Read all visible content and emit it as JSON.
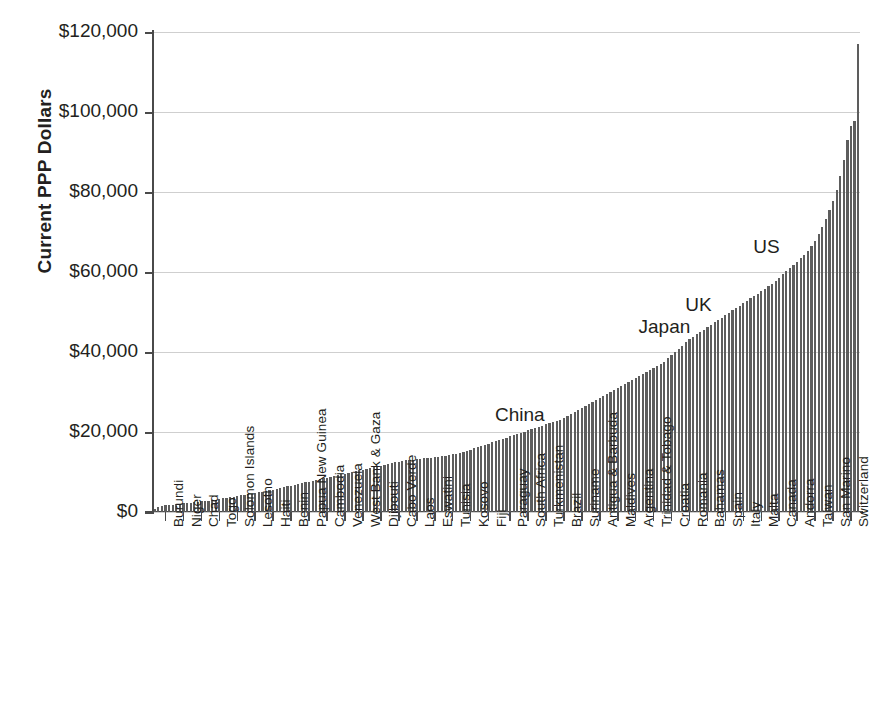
{
  "chart_data": {
    "type": "bar",
    "title": "",
    "subtitle": "",
    "xlabel": "",
    "ylabel": "Current PPP Dollars",
    "ylim": [
      0,
      120000
    ],
    "y_ticks": [
      0,
      20000,
      40000,
      60000,
      80000,
      100000,
      120000
    ],
    "y_tick_labels": [
      "$0",
      "$20,000",
      "$40,000",
      "$60,000",
      "$80,000",
      "$100,000",
      "$120,000"
    ],
    "grid": true,
    "legend": "none",
    "bar_color": "#5d5d5d",
    "gridline_color": "#cfcfcf",
    "axis_color": "#4a4a4a",
    "x_tick_labels": [
      "Burundi",
      "Niger",
      "Chad",
      "Togo",
      "Solomon Islands",
      "Lesotho",
      "Haiti",
      "Benin",
      "Papua New Guinea",
      "Cambodia",
      "Venezuela",
      "West Bank & Gaza",
      "Djibouti",
      "Cabo Verde",
      "Laos",
      "Eswatini",
      "Tunisia",
      "Kosovo",
      "Fiji",
      "Paraguay",
      "South Africa",
      "Turkmenistan",
      "Brazil",
      "Suriname",
      "Antigua & Barbuda",
      "Maldives",
      "Argentina",
      "Trinidad & Tobago",
      "Croatia",
      "Romania",
      "Bahamas",
      "Spain",
      "Italy",
      "Malta",
      "Canada",
      "Andorra",
      "Taiwan",
      "San Marino",
      "Switzerland"
    ],
    "annotations": [
      {
        "label": "China",
        "value": 21000,
        "x_index": 112
      },
      {
        "label": "Japan",
        "value": 43000,
        "x_index": 152
      },
      {
        "label": "UK",
        "value": 48500,
        "x_index": 165
      },
      {
        "label": "US",
        "value": 63000,
        "x_index": 184
      }
    ],
    "values": [
      850,
      1300,
      1550,
      1650,
      1750,
      1850,
      1950,
      2050,
      2150,
      2250,
      2350,
      2450,
      2550,
      2650,
      2750,
      2850,
      2950,
      3100,
      3250,
      3400,
      3550,
      3700,
      3850,
      4000,
      4150,
      4300,
      4450,
      4600,
      4750,
      4900,
      5050,
      5200,
      5400,
      5600,
      5800,
      6000,
      6200,
      6400,
      6600,
      6800,
      7000,
      7200,
      7400,
      7600,
      7800,
      8000,
      8200,
      8400,
      8600,
      8800,
      9000,
      9200,
      9400,
      9600,
      9800,
      10000,
      10200,
      10400,
      10600,
      10800,
      11000,
      11200,
      11400,
      11600,
      11800,
      12000,
      12200,
      12400,
      12600,
      12800,
      12900,
      13000,
      13100,
      13200,
      13300,
      13400,
      13500,
      13600,
      13700,
      13800,
      13900,
      14000,
      14200,
      14400,
      14600,
      14800,
      15000,
      15300,
      15600,
      15900,
      16200,
      16500,
      16800,
      17100,
      17400,
      17700,
      18000,
      18300,
      18600,
      18900,
      19200,
      19500,
      19800,
      20100,
      20400,
      20700,
      21000,
      21300,
      21600,
      21900,
      22200,
      22500,
      22800,
      23100,
      23500,
      24000,
      24500,
      25000,
      25500,
      26000,
      26500,
      27000,
      27500,
      28000,
      28500,
      29000,
      29500,
      30000,
      30500,
      31000,
      31500,
      32000,
      32500,
      33000,
      33500,
      34000,
      34500,
      35000,
      35500,
      36000,
      36500,
      37000,
      37600,
      38400,
      39200,
      40000,
      40800,
      41600,
      42400,
      43200,
      43800,
      44400,
      45000,
      45600,
      46200,
      46800,
      47400,
      48000,
      48600,
      49200,
      49800,
      50400,
      51000,
      51600,
      52200,
      52800,
      53400,
      54000,
      54600,
      55200,
      55800,
      56400,
      57000,
      57800,
      58600,
      59400,
      60200,
      61000,
      61800,
      62600,
      63400,
      64200,
      65200,
      66400,
      67800,
      69400,
      71200,
      73200,
      75400,
      77800,
      80600,
      84000,
      88000,
      93000,
      96500,
      97800,
      117000
    ]
  }
}
